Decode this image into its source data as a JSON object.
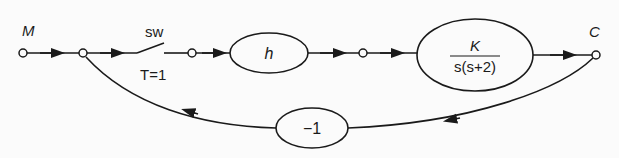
{
  "diagram": {
    "type": "signal-flow-graph",
    "nodes": [
      {
        "id": "M",
        "label": "M",
        "x": 23,
        "y": 53
      },
      {
        "id": "n2",
        "label": "",
        "x": 83,
        "y": 53
      },
      {
        "id": "n3",
        "label": "",
        "x": 192,
        "y": 53
      },
      {
        "id": "n4",
        "label": "",
        "x": 363,
        "y": 53
      },
      {
        "id": "C",
        "label": "C",
        "x": 596,
        "y": 55
      }
    ],
    "switch": {
      "label": "sw",
      "sampling": "T=1"
    },
    "blocks": {
      "h": {
        "label": "h"
      },
      "plant": {
        "numerator": "K",
        "denominator": "s(s+2)"
      },
      "feedback": {
        "label": "−1"
      }
    },
    "labels": {
      "input": "M",
      "output": "C",
      "switch": "sw",
      "period": "T=1"
    },
    "stroke_color": "#1a1a1a",
    "background": "#fbfbfb"
  }
}
